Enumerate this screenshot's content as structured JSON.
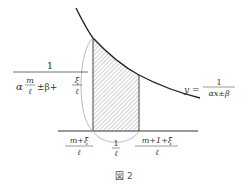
{
  "figure": {
    "caption": "図 2",
    "curve_label": {
      "lhs": "y =",
      "numerator": "1",
      "denominator": "αx±β"
    },
    "height_label": {
      "numerator": "1",
      "denominator_parts": {
        "alpha": "α",
        "m": "m",
        "ell": "ℓ",
        "pm_beta_plus": "±β+",
        "xi": "ξ",
        "ell2": "ℓ"
      }
    },
    "x_labels": {
      "left": {
        "numerator": "m+ξ",
        "denominator": "ℓ"
      },
      "width": {
        "numerator": "1",
        "denominator": "ℓ"
      },
      "right": {
        "numerator": "m+1+ξ",
        "denominator": "ℓ"
      }
    },
    "colors": {
      "curve": "#222222",
      "axis": "#333333",
      "hatch": "#888888",
      "brace": "#999999"
    }
  }
}
